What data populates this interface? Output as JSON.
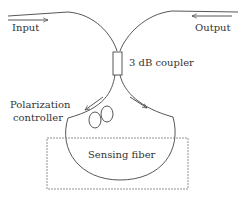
{
  "diagram": {
    "labels": {
      "input": "Input",
      "output": "Output",
      "coupler": "3 dB coupler",
      "pc_line1": "Polarization",
      "pc_line2": "controller",
      "sensing": "Sensing fiber"
    },
    "colors": {
      "line": "#444444",
      "text": "#333333",
      "background": "#ffffff"
    }
  }
}
